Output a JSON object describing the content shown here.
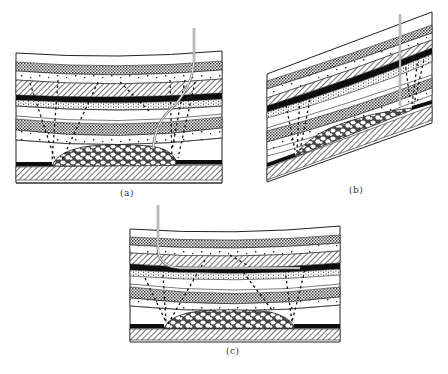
{
  "figure": {
    "colors": {
      "ink": "#111111",
      "background": "#ffffff",
      "coal_seam": "#0d0d0d",
      "well_casing": "#777777"
    },
    "panels": [
      {
        "id": "a",
        "label": "(a)",
        "well": "vertical then curved",
        "strata": "horizontal, gently sagging"
      },
      {
        "id": "b",
        "label": "(b)",
        "well": "vertical",
        "strata": "inclined"
      },
      {
        "id": "c",
        "label": "(c)",
        "well": "vertical then horizontal along seam",
        "strata": "horizontal, gently sagging"
      }
    ]
  }
}
